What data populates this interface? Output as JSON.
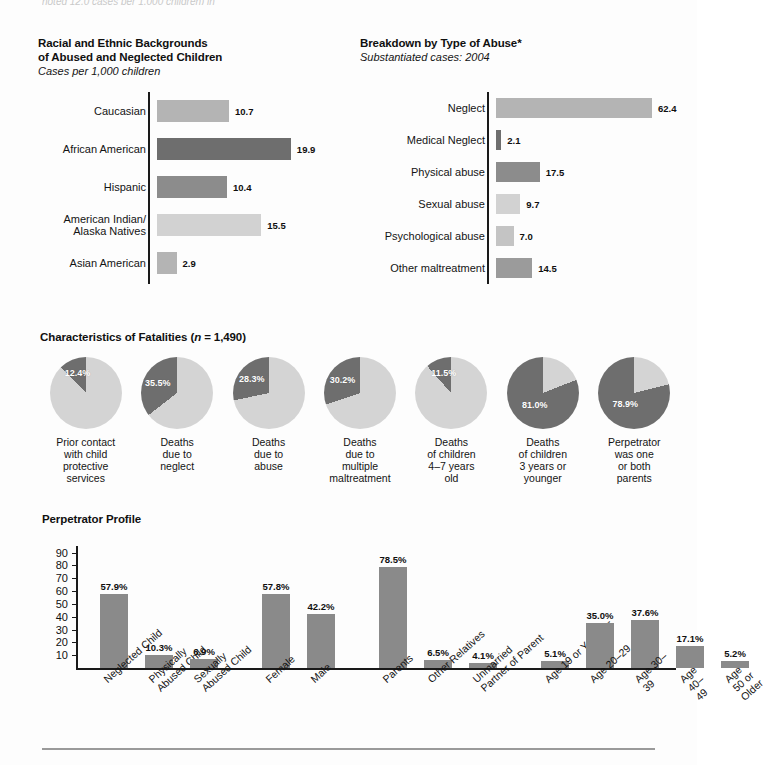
{
  "page": {
    "top_clipped_line": "noted 12.0 cases per 1,000 children) in",
    "background": "#fdfdfd"
  },
  "colors": {
    "bar_light": "#b4b4b4",
    "bar_lighter": "#d2d2d2",
    "bar_medium": "#8c8c8c",
    "bar_dark": "#6e6e6e",
    "pie_dark": "#6e6e6e",
    "pie_light": "#d4d4d4",
    "axis": "#1a1a1a",
    "vbar": "#8a8a8a"
  },
  "chart_data": [
    {
      "id": "racial-ethnic-backgrounds",
      "type": "bar",
      "orientation": "horizontal",
      "title": "Racial and Ethnic Backgrounds\nof Abused and Neglected Children",
      "title_line1": "Racial and Ethnic Backgrounds",
      "title_line2": "of Abused and Neglected Children",
      "subtitle": "Cases per 1,000 children",
      "xlabel": "",
      "ylabel": "",
      "grid": false,
      "legend": "none",
      "xlim": [
        0,
        22
      ],
      "categories": [
        "Caucasian",
        "African American",
        "Hispanic",
        "American Indian/\nAlaska Natives",
        "Asian American"
      ],
      "values": [
        10.7,
        19.9,
        10.4,
        15.5,
        2.9
      ],
      "value_labels": [
        "10.7",
        "19.9",
        "10.4",
        "15.5",
        "2.9"
      ],
      "bar_colors": [
        "#b4b4b4",
        "#6e6e6e",
        "#8c8c8c",
        "#d2d2d2",
        "#b4b4b4"
      ]
    },
    {
      "id": "breakdown-by-type-of-abuse",
      "type": "bar",
      "orientation": "horizontal",
      "title": "Breakdown by Type of Abuse*",
      "subtitle": "Substantiated cases: 2004",
      "xlabel": "",
      "ylabel": "",
      "grid": false,
      "legend": "none",
      "xlim": [
        0,
        70
      ],
      "categories": [
        "Neglect",
        "Medical Neglect",
        "Physical abuse",
        "Sexual abuse",
        "Psychological abuse",
        "Other maltreatment"
      ],
      "values": [
        62.4,
        2.1,
        17.5,
        9.7,
        7.0,
        14.5
      ],
      "value_labels": [
        "62.4",
        "2.1",
        "17.5",
        "9.7",
        "7.0",
        "14.5"
      ],
      "bar_colors": [
        "#b4b4b4",
        "#6e6e6e",
        "#8c8c8c",
        "#d2d2d2",
        "#c4c4c4",
        "#9b9b9b"
      ]
    },
    {
      "id": "characteristics-of-fatalities",
      "type": "pie",
      "title": "Characteristics of Fatalities (n = 1,490)",
      "title_main": "Characteristics of Fatalities (",
      "title_italic_n": "n",
      "title_tail": " = 1,490)",
      "legend": "none",
      "slices": [
        {
          "label": "Prior contact\nwith child\nprotective\nservices",
          "value": 12.4,
          "value_label": "12.4%"
        },
        {
          "label": "Deaths\ndue to\nneglect",
          "value": 35.5,
          "value_label": "35.5%"
        },
        {
          "label": "Deaths\ndue to\nabuse",
          "value": 28.3,
          "value_label": "28.3%"
        },
        {
          "label": "Deaths\ndue to\nmultiple\nmaltreatment",
          "value": 30.2,
          "value_label": "30.2%"
        },
        {
          "label": "Deaths\nof children\n4–7 years\nold",
          "value": 11.5,
          "value_label": "11.5%"
        },
        {
          "label": "Deaths\nof children\n3 years or\nyounger",
          "value": 81.0,
          "value_label": "81.0%"
        },
        {
          "label": "Perpetrator\nwas one\nor both\nparents",
          "value": 78.9,
          "value_label": "78.9%"
        }
      ]
    },
    {
      "id": "perpetrator-profile",
      "type": "bar",
      "orientation": "vertical",
      "title": "Perpetrator Profile",
      "subtitle": "",
      "xlabel": "",
      "ylabel": "",
      "grid": false,
      "legend": "none",
      "ylim": [
        0,
        92
      ],
      "yticks": [
        90,
        80,
        70,
        60,
        50,
        40,
        30,
        20,
        10
      ],
      "categories": [
        "Neglected Child",
        "Physically\nAbused Child",
        "Sexually\nAbused Child",
        "Female",
        "Male",
        "Parents",
        "Other Relatives",
        "Unmarried\nPartner of Parent",
        "Age 19 or Younger",
        "Age 20–29",
        "Age 30–39",
        "Age 40–49",
        "Age 50 or Older"
      ],
      "values": [
        57.9,
        10.3,
        6.9,
        57.8,
        42.2,
        78.5,
        6.5,
        4.1,
        5.1,
        35.0,
        37.6,
        17.1,
        5.2
      ],
      "value_labels": [
        "57.9%",
        "10.3%",
        "6.9%",
        "57.8%",
        "42.2%",
        "78.5%",
        "6.5%",
        "4.1%",
        "5.1%",
        "35.0%",
        "37.6%",
        "17.1%",
        "5.2%"
      ],
      "groups": [
        {
          "name": "victim-type",
          "indices": [
            0,
            1,
            2
          ]
        },
        {
          "name": "sex",
          "indices": [
            3,
            4
          ]
        },
        {
          "name": "relationship",
          "indices": [
            5,
            6,
            7
          ]
        },
        {
          "name": "age",
          "indices": [
            8,
            9,
            10,
            11,
            12
          ]
        }
      ]
    }
  ]
}
